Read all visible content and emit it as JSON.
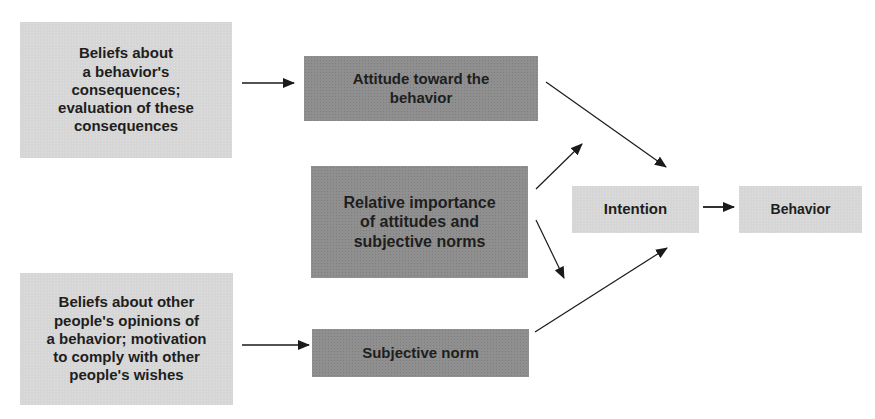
{
  "diagram": {
    "type": "flow-diagram",
    "colors": {
      "light_box": "#d6d6d6",
      "dark_box": "#8f8f8f",
      "text": "#1e1e1e",
      "arrow": "#1a1a1a",
      "background": "#ffffff"
    },
    "nodes": {
      "beliefs_consequences": {
        "label": "Beliefs about\n a behavior's\nconsequences;\nevaluation of these\nconsequences",
        "shade": "light"
      },
      "attitude": {
        "label": "Attitude toward the\nbehavior",
        "shade": "dark"
      },
      "relative_importance": {
        "label": "Relative importance\nof attitudes and\nsubjective norms",
        "shade": "dark"
      },
      "beliefs_others": {
        "label": "Beliefs about other\npeople's opinions of\na behavior; motivation\nto comply with other\npeople's wishes",
        "shade": "light"
      },
      "subjective_norm": {
        "label": "Subjective norm",
        "shade": "dark"
      },
      "intention": {
        "label": "Intention",
        "shade": "light"
      },
      "behavior": {
        "label": "Behavior",
        "shade": "light"
      }
    },
    "edges": [
      {
        "from": "beliefs_consequences",
        "to": "attitude"
      },
      {
        "from": "attitude",
        "to": "intention"
      },
      {
        "from": "relative_importance",
        "to": "attitude"
      },
      {
        "from": "relative_importance",
        "to": "subjective_norm"
      },
      {
        "from": "beliefs_others",
        "to": "subjective_norm"
      },
      {
        "from": "subjective_norm",
        "to": "intention"
      },
      {
        "from": "intention",
        "to": "behavior"
      }
    ]
  }
}
